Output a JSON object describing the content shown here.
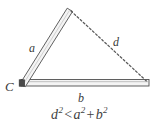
{
  "figure": {
    "type": "geometry-diagram",
    "background_color": "#ffffff",
    "stroke_color": "#4a4a4a",
    "bar_fill_color": "#f2f2f2",
    "bar_highlight_color": "#d9d9d9",
    "dash_color": "#555555",
    "text_color": "#3f3f3f",
    "labels": {
      "side_a": "a",
      "side_b": "b",
      "diagonal_d": "d",
      "vertex_c": "C"
    },
    "formula": {
      "left_base": "d",
      "left_exponent": "2",
      "relation": "<",
      "first_base": "a",
      "first_exponent": "2",
      "plus": "+",
      "second_base": "b",
      "second_exponent": "2",
      "plain_text": "d2 < a2 + b2"
    },
    "geometry": {
      "vertex_c": [
        22,
        84
      ],
      "vertex_a_end": [
        70,
        10
      ],
      "vertex_b_end": [
        148,
        84
      ],
      "bar_a_thickness": 5,
      "bar_b_thickness": 7,
      "dash_pattern": "2 2"
    }
  }
}
